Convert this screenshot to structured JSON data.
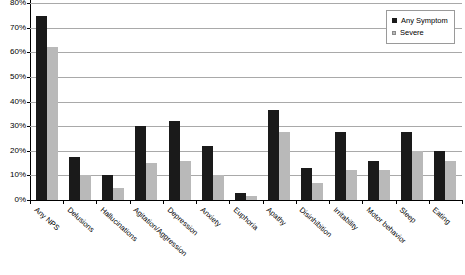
{
  "chart_data": {
    "type": "bar",
    "title": "",
    "xlabel": "",
    "ylabel": "",
    "ylim": [
      0,
      80
    ],
    "grid": true,
    "legend_position": "top-right",
    "ytick_labels": [
      "0%",
      "10%",
      "20%",
      "30%",
      "40%",
      "50%",
      "60%",
      "70%",
      "80%"
    ],
    "ytick_values": [
      0,
      10,
      20,
      30,
      40,
      50,
      60,
      70,
      80
    ],
    "categories": [
      "Any NPS",
      "Delusions",
      "Hallucinations",
      "Agitation/Aggression",
      "Depression",
      "Anxiety",
      "Euphoria",
      "Apathy",
      "Disinhibition",
      "Irritability",
      "Motor behavior",
      "Sleep",
      "Eating"
    ],
    "series": [
      {
        "name": "Any Symptom",
        "color": "#1a1a1a",
        "values": [
          75,
          17.5,
          10,
          30,
          32,
          22,
          3,
          36.5,
          13,
          27.5,
          16,
          27.5,
          20
        ]
      },
      {
        "name": "Severe",
        "color": "#b9b9b9",
        "values": [
          62,
          10,
          5,
          15,
          16,
          10,
          1.5,
          27.5,
          7,
          12,
          12,
          20,
          16
        ]
      }
    ]
  },
  "legend": {
    "items": [
      {
        "label": "Any Symptom",
        "swatch": "black-square-icon"
      },
      {
        "label": "Severe",
        "swatch": "gray-square-icon"
      }
    ]
  }
}
